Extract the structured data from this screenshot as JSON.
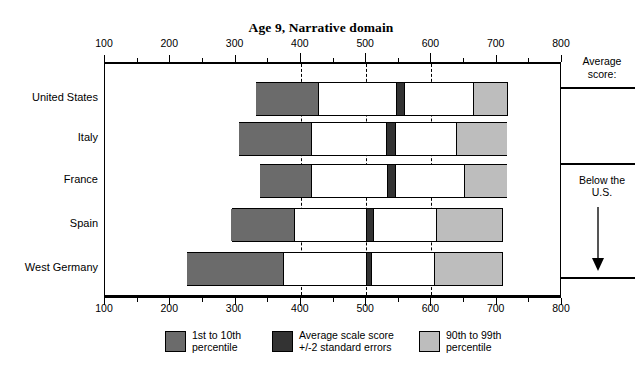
{
  "chart_data": {
    "type": "bar",
    "title": "Age 9, Narrative domain",
    "xlabel": "",
    "ylabel": "",
    "xlim": [
      100,
      800
    ],
    "xticks": [
      100,
      200,
      300,
      400,
      500,
      600,
      700,
      800
    ],
    "xtick_labels": [
      "100",
      "200",
      "300",
      "400",
      "500",
      "600",
      "700",
      "800"
    ],
    "minor_tick_step": 50,
    "gridlines": [
      400,
      500,
      600
    ],
    "grid": "dashed vertical at 400, 500, 600",
    "legend_position": "below-plot",
    "categories": [
      "United States",
      "Italy",
      "France",
      "Spain",
      "West Germany"
    ],
    "series": [
      {
        "name": "1st to 10th percentile",
        "color": "#6b6b6b",
        "values": [
          [
            332,
            429
          ],
          [
            306,
            417
          ],
          [
            338,
            417
          ],
          [
            294,
            392
          ],
          [
            226,
            375
          ]
        ]
      },
      {
        "name": "Average scale score +/-2 standard errors",
        "color": "#333333",
        "values": [
          [
            547,
            560
          ],
          [
            531,
            546
          ],
          [
            533,
            546
          ],
          [
            501,
            512
          ],
          [
            500,
            509
          ]
        ]
      },
      {
        "name": "90th to 99th percentile",
        "color": "#bdbdbd",
        "values": [
          [
            665,
            717
          ],
          [
            639,
            716
          ],
          [
            651,
            716
          ],
          [
            607,
            709
          ],
          [
            604,
            709
          ]
        ]
      }
    ],
    "bar_extents": [
      {
        "category": "United States",
        "start": 332,
        "end": 717
      },
      {
        "category": "Italy",
        "start": 306,
        "end": 716
      },
      {
        "category": "France",
        "start": 338,
        "end": 716
      },
      {
        "category": "Spain",
        "start": 294,
        "end": 709
      },
      {
        "category": "West Germany",
        "start": 226,
        "end": 709
      }
    ]
  },
  "title": "Age 9, Narrative domain",
  "axis": {
    "ticks": [
      {
        "value": 100,
        "label": "100"
      },
      {
        "value": 200,
        "label": "200"
      },
      {
        "value": 300,
        "label": "300"
      },
      {
        "value": 400,
        "label": "400"
      },
      {
        "value": 500,
        "label": "500"
      },
      {
        "value": 600,
        "label": "600"
      },
      {
        "value": 700,
        "label": "700"
      },
      {
        "value": 800,
        "label": "800"
      }
    ]
  },
  "countries": [
    {
      "label": "United States"
    },
    {
      "label": "Italy"
    },
    {
      "label": "France"
    },
    {
      "label": "Spain"
    },
    {
      "label": "West Germany"
    }
  ],
  "right_panel": {
    "average_score_line1": "Average",
    "average_score_line2": "score:",
    "below_line1": "Below the",
    "below_line2": "U.S."
  },
  "legend": {
    "items": [
      {
        "line1": "1st to 10th",
        "line2": "percentile",
        "color": "#6b6b6b"
      },
      {
        "line1": "Average scale score",
        "line2": "+/-2 standard errors",
        "color": "#333333"
      },
      {
        "line1": "90th to 99th",
        "line2": "percentile",
        "color": "#bdbdbd"
      }
    ]
  }
}
